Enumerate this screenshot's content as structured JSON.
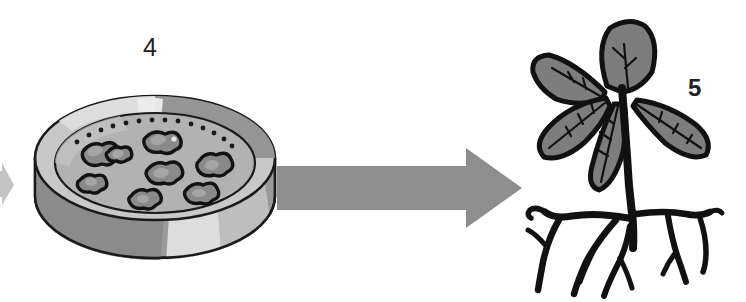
{
  "figure": {
    "type": "process-diagram",
    "title": "",
    "background_color": "#ffffff",
    "steps": [
      {
        "number": "4",
        "name": "petri-dish-with-colonies",
        "description": "Petri dish containing culture medium with callus colonies"
      },
      {
        "number": "5",
        "name": "regenerated-plantlet",
        "description": "Regenerated plantlet with leaves and root system"
      }
    ]
  },
  "labels": {
    "step_four": "4",
    "step_five": "5"
  },
  "petri_dish": {
    "name": "petri-dish",
    "medium_color": "#b0b0b0",
    "rim_light_color": "#d4d4d4",
    "rim_shadow_color": "#8a8a8a",
    "side_dark_color": "#8f8f8f",
    "side_light_color": "#dedede",
    "outline_color": "#1a1a1a",
    "colony_count": 8,
    "colony_fill": "#8a8a8a",
    "colony_outline": "#121212",
    "dotted_arc_dots": 14
  },
  "arrows": {
    "main": {
      "name": "transition-arrow",
      "color": "#8c8c8c",
      "direction": "right",
      "from_step": "4",
      "to_step": "5"
    },
    "incoming_fragment": {
      "name": "incoming-arrow-fragment",
      "color": "#b5b5b5",
      "direction": "right"
    }
  },
  "plantlet": {
    "name": "plantlet",
    "leaf_fill": "#7d7d7d",
    "leaf_outline": "#111111",
    "stem_color": "#111111",
    "root_color": "#111111",
    "leaf_count": 5,
    "root_branch_count": 7
  }
}
